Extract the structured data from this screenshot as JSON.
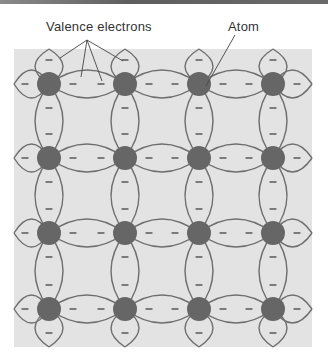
{
  "labels": {
    "valence": "Valence electrons",
    "atom": "Atom"
  },
  "colors": {
    "panel": "#e3e3e3",
    "bond_line": "#6e6e6e",
    "atom_fill": "#666666",
    "electron": "#444444",
    "label_text": "#333333"
  },
  "lattice": {
    "columns": [
      49,
      125,
      199,
      273
    ],
    "rows": [
      84,
      158,
      233,
      309
    ],
    "atom_radius": 12,
    "electron_symbol": "–"
  }
}
